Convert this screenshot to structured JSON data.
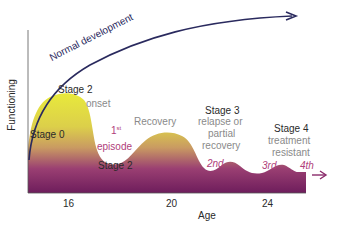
{
  "diagram": {
    "y_axis_label": "Functioning",
    "x_axis_label": "Age",
    "x_ticks": [
      "16",
      "20",
      "24"
    ],
    "normal_curve_label": "Normal development",
    "labels": {
      "stage0": "Stage 0",
      "stage2_top": "Stage 2",
      "onset": "onset",
      "first_episode_num": "1",
      "first_episode_sup": "st",
      "first_episode_word": "episode",
      "stage2_bottom": "Stage 2",
      "recovery": "Recovery",
      "stage3": "Stage 3",
      "stage3_desc_1": "relapse or",
      "stage3_desc_2": "partial",
      "stage3_desc_3": "recovery",
      "second": "2nd",
      "stage4": "Stage 4",
      "stage4_desc_1": "treatment",
      "stage4_desc_2": "resistant",
      "third": "3rd",
      "fourth": "4th"
    },
    "colors": {
      "curve": "#2a2a5e",
      "gradient_top": "#e8e83a",
      "gradient_mid": "#c9a060",
      "gradient_bottom": "#6e1a5c",
      "episode_text": "#b0407a"
    }
  }
}
